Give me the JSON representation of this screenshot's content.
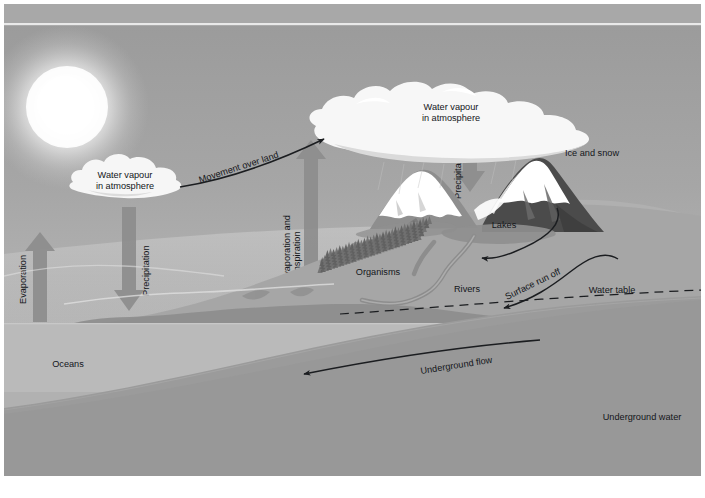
{
  "diagram": {
    "type": "hydrological-cycle-schematic",
    "palette": {
      "sky_top": "#9d9d9d",
      "sky_bottom": "#b4b4b4",
      "sun_core": "#ffffff",
      "cloud": "#f4f4f4",
      "land": "#a3a3a3",
      "land_far": "#b9b9b9",
      "ocean": "#b9b9b9",
      "underground": "#8e8e8e",
      "bedrock": "#9c9c9c",
      "mountain_dark": "#4f4f4f",
      "snow": "#ffffff",
      "arrow_block": "#8a8a8a",
      "ink": "#14161a",
      "frame_border": "#ffffff"
    },
    "labels": {
      "cloud_left": {
        "line1": "Water vapour",
        "line2": "in atmosphere"
      },
      "cloud_right": {
        "line1": "Water vapour",
        "line2": "in atmosphere"
      },
      "movement_over_land": "Movement over land",
      "evaporation": "Evaporation",
      "precipitation_left": "Precipitation",
      "precipitation_right": "Precipitation",
      "evaporation_and_transpiration": {
        "line1": "Evaporation and",
        "line2": "transpiration"
      },
      "ice_and_snow": "Ice and snow",
      "lakes": "Lakes",
      "organisms": "Organisms",
      "rivers": "Rivers",
      "surface_run_off": "Surface run off",
      "water_table": "Water table",
      "underground_flow": "Underground flow",
      "underground_water": "Underground water",
      "oceans": "Oceans"
    },
    "flows": [
      {
        "name": "evaporation",
        "from": "oceans",
        "to": "atmosphere",
        "style": "block-arrow-up"
      },
      {
        "name": "precipitation-left",
        "from": "atmosphere",
        "to": "oceans",
        "style": "block-arrow-down"
      },
      {
        "name": "evaporation-and-transpiration",
        "from": "land",
        "to": "atmosphere",
        "style": "block-arrow-up"
      },
      {
        "name": "precipitation-right",
        "from": "atmosphere",
        "to": "mountains",
        "style": "block-arrow-down"
      },
      {
        "name": "movement-over-land",
        "from": "cloud-left",
        "to": "cloud-right",
        "style": "line-arrow"
      },
      {
        "name": "lakes-outflow",
        "from": "lakes",
        "to": "rivers",
        "style": "curved-arrow"
      },
      {
        "name": "surface-run-off",
        "from": "hillslope",
        "to": "rivers",
        "style": "curved-arrow"
      },
      {
        "name": "underground-flow",
        "from": "inland-aquifer",
        "to": "oceans",
        "style": "curved-arrow"
      }
    ]
  }
}
